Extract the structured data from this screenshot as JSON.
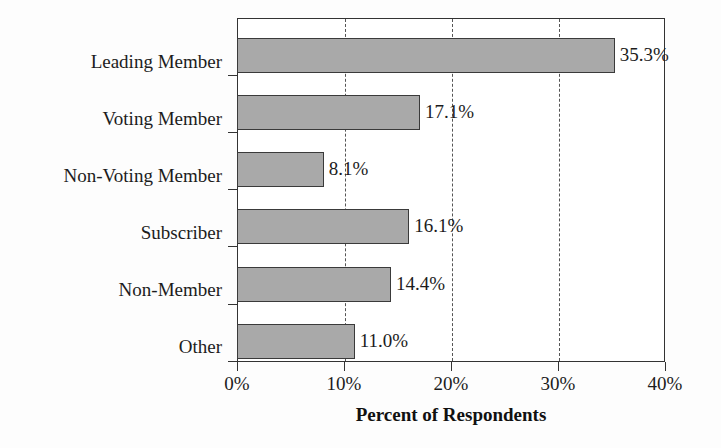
{
  "chart_data": {
    "type": "bar",
    "orientation": "horizontal",
    "title": "",
    "xlabel": "Percent of Respondents",
    "ylabel": "",
    "xlim": [
      0,
      40
    ],
    "grid": "vertical-dashed-at-xticks",
    "legend": "none",
    "categories": [
      "Leading Member",
      "Voting Member",
      "Non-Voting Member",
      "Subscriber",
      "Non-Member",
      "Other"
    ],
    "values": [
      35.3,
      17.1,
      8.1,
      16.1,
      14.4,
      11.0
    ],
    "value_labels": [
      "35.3%",
      "17.1%",
      "8.1%",
      "16.1%",
      "14.4%",
      "11.0%"
    ],
    "xticks": [
      0,
      10,
      20,
      30,
      40
    ],
    "xtick_labels": [
      "0%",
      "10%",
      "20%",
      "30%",
      "40%"
    ],
    "bar_fill_color": "#a9a9a9",
    "bar_edge_color": "#3a3a3a",
    "frame_color": "#333333",
    "grid_color": "#555555",
    "background_color": "#fdfdfd",
    "text_color": "#1c1c1c"
  }
}
